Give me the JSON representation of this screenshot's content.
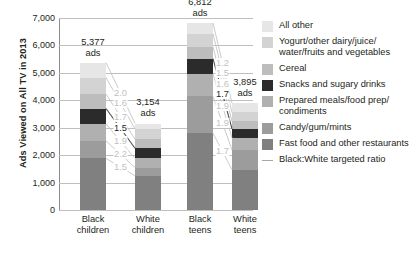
{
  "chart_data": {
    "type": "bar",
    "title": "",
    "xlabel": "",
    "ylabel": "Ads Viewed on All TV in 2013",
    "ylim": [
      0,
      7000
    ],
    "ytick_labels": [
      "0",
      "1,000",
      "2,000",
      "3,000",
      "4,000",
      "5,000",
      "6,000",
      "7,000"
    ],
    "ytick_values": [
      0,
      1000,
      2000,
      3000,
      4000,
      5000,
      6000,
      7000
    ],
    "grid": true,
    "legend_position": "right",
    "stacked": true,
    "categories": [
      "Black children",
      "White children",
      "Black teens",
      "White teens"
    ],
    "category_lines": [
      [
        "Black",
        "children"
      ],
      [
        "White",
        "children"
      ],
      [
        "Black",
        "teens"
      ],
      [
        "White",
        "teens"
      ]
    ],
    "totals": [
      5377,
      3154,
      6812,
      3895
    ],
    "total_labels": [
      "5,377",
      "3,154",
      "6,812",
      "3,895"
    ],
    "total_label_unit": "ads",
    "series": [
      {
        "name": "Fast food and other restaurants",
        "color": "#808080",
        "values": [
          1880,
          1250,
          2800,
          1470
        ]
      },
      {
        "name": "Candy/gum/mints",
        "color": "#9c9c9c",
        "values": [
          640,
          300,
          1340,
          720
        ]
      },
      {
        "name": "Prepared meals/food prep/condiments",
        "color": "#b0b0b0",
        "values": [
          620,
          330,
          820,
          440
        ]
      },
      {
        "name": "Snacks and sugary drinks",
        "color": "#2b2b2b",
        "values": [
          560,
          370,
          560,
          330
        ]
      },
      {
        "name": "Cereal",
        "color": "#bdbdbd",
        "values": [
          530,
          330,
          430,
          270
        ]
      },
      {
        "name": "Yogurt/other dairy/juice/water/fruits and vegetables",
        "color": "#d3d3d3",
        "values": [
          600,
          380,
          480,
          330
        ]
      },
      {
        "name": "All other",
        "color": "#e6e6e6",
        "values": [
          547,
          194,
          382,
          335
        ]
      }
    ],
    "ratio_label_title": "Black:White targeted ratio",
    "ratio_groups": [
      {
        "pair": "children",
        "labels": [
          "2.0",
          "1.6",
          "1.7",
          "1.5",
          "1.9",
          "2.2",
          "1.5"
        ]
      },
      {
        "pair": "teens",
        "labels": [
          "1.2",
          "1.5",
          "1.6",
          "1.7",
          "1.9",
          "1.9",
          "1.7"
        ]
      }
    ],
    "ratio_highlight": [
      "1.5",
      "1.7"
    ]
  },
  "legend": {
    "items": [
      {
        "label": "All other",
        "color": "#e6e6e6",
        "type": "swatch"
      },
      {
        "label": "Yogurt/other dairy/juice/ water/fruits and vegetables",
        "color": "#d3d3d3",
        "type": "swatch"
      },
      {
        "label": "Cereal",
        "color": "#bdbdbd",
        "type": "swatch"
      },
      {
        "label": "Snacks and sugary drinks",
        "color": "#2b2b2b",
        "type": "swatch"
      },
      {
        "label": "Prepared meals/food prep/ condiments",
        "color": "#b0b0b0",
        "type": "swatch"
      },
      {
        "label": "Candy/gum/mints",
        "color": "#9c9c9c",
        "type": "swatch"
      },
      {
        "label": "Fast food and other restaurants",
        "color": "#808080",
        "type": "swatch"
      },
      {
        "label": "Black:White targeted ratio",
        "color": "#a6a6a6",
        "type": "line"
      }
    ]
  }
}
